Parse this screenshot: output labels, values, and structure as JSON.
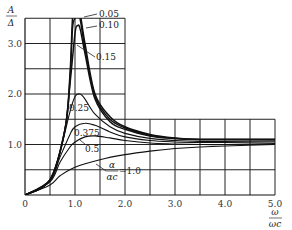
{
  "chart_data": {
    "type": "line",
    "title": "",
    "xlabel": "ω/ωc",
    "ylabel": "A/Δ",
    "xlim": [
      0,
      5.0
    ],
    "ylim": [
      0,
      3.5
    ],
    "grid": true,
    "x_ticks": [
      "0",
      "1.0",
      "2.0",
      "3.0",
      "4.0",
      "5.0"
    ],
    "y_ticks": [
      "1.0",
      "2.0",
      "3.0"
    ],
    "legend_title": "α/αc",
    "series": [
      {
        "name": "0.05",
        "x": [
          0,
          0.5,
          0.8,
          0.9,
          0.95,
          1.0,
          1.05,
          1.1,
          1.2,
          1.4,
          1.7,
          2.0,
          2.5,
          3.0,
          3.5,
          4.0,
          5.0
        ],
        "values": [
          0,
          0.3,
          1.3,
          2.4,
          3.5,
          3.6,
          3.6,
          3.6,
          3.0,
          2.0,
          1.55,
          1.35,
          1.2,
          1.13,
          1.1,
          1.1,
          1.1
        ]
      },
      {
        "name": "0.10",
        "x": [
          0,
          0.5,
          0.8,
          0.9,
          0.95,
          1.0,
          1.05,
          1.1,
          1.2,
          1.4,
          1.7,
          2.0,
          2.5,
          3.0,
          3.5,
          4.0,
          5.0
        ],
        "values": [
          0,
          0.3,
          1.3,
          2.3,
          3.3,
          3.5,
          3.6,
          3.5,
          2.9,
          1.95,
          1.5,
          1.33,
          1.18,
          1.12,
          1.1,
          1.1,
          1.1
        ]
      },
      {
        "name": "0.15",
        "x": [
          0,
          0.5,
          0.8,
          0.9,
          1.0,
          1.05,
          1.1,
          1.2,
          1.4,
          1.7,
          2.0,
          2.5,
          3.0,
          3.5,
          4.0,
          5.0
        ],
        "values": [
          0,
          0.3,
          1.3,
          2.2,
          3.2,
          3.35,
          3.3,
          2.8,
          1.9,
          1.45,
          1.3,
          1.17,
          1.12,
          1.1,
          1.1,
          1.1
        ]
      },
      {
        "name": "0.25",
        "x": [
          0,
          0.5,
          0.7,
          0.9,
          1.0,
          1.1,
          1.2,
          1.4,
          1.7,
          2.0,
          2.5,
          3.0,
          3.5,
          4.0,
          5.0
        ],
        "values": [
          0,
          0.3,
          0.85,
          1.65,
          1.95,
          2.0,
          1.9,
          1.6,
          1.35,
          1.22,
          1.12,
          1.08,
          1.06,
          1.06,
          1.07
        ]
      },
      {
        "name": "0.375",
        "x": [
          0,
          0.5,
          0.7,
          0.9,
          1.0,
          1.2,
          1.4,
          1.7,
          2.0,
          2.5,
          3.0,
          3.5,
          4.0,
          5.0
        ],
        "values": [
          0,
          0.28,
          0.75,
          1.2,
          1.35,
          1.42,
          1.38,
          1.25,
          1.15,
          1.08,
          1.05,
          1.04,
          1.04,
          1.05
        ]
      },
      {
        "name": "0.5",
        "x": [
          0,
          0.5,
          0.7,
          0.9,
          1.0,
          1.2,
          1.4,
          1.7,
          2.0,
          2.5,
          3.0,
          3.5,
          4.0,
          5.0
        ],
        "values": [
          0,
          0.26,
          0.65,
          0.95,
          1.05,
          1.15,
          1.17,
          1.13,
          1.08,
          1.03,
          1.01,
          1.0,
          1.0,
          1.02
        ]
      },
      {
        "name": "1.0",
        "x": [
          0,
          0.5,
          0.7,
          1.0,
          1.5,
          2.0,
          2.5,
          3.0,
          3.5,
          4.0,
          5.0
        ],
        "values": [
          0,
          0.2,
          0.38,
          0.55,
          0.7,
          0.8,
          0.87,
          0.92,
          0.95,
          0.97,
          1.0
        ]
      }
    ],
    "annotations": [
      "0.05",
      "0.10",
      "0.15",
      "0.25",
      "0.375",
      "0.5",
      "α/αc=1.0"
    ]
  },
  "axes": {
    "ylabel_num": "A",
    "ylabel_den": "Δ",
    "xlabel_num": "ω",
    "xlabel_den": "ωc",
    "legend_num": "α",
    "legend_den": "αc",
    "legend_eq": "=1.0"
  }
}
